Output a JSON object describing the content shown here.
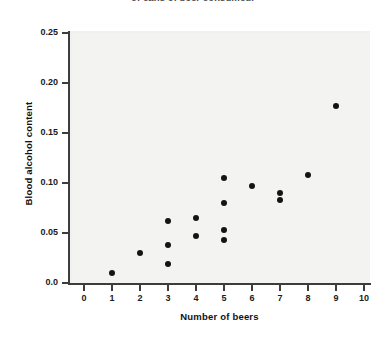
{
  "title": {
    "text": "of cans of beer consumed.",
    "clipped": true
  },
  "axis": {
    "xlabel": "Number of beers",
    "ylabel": "Blood alcohol content"
  },
  "chart_data": {
    "type": "scatter",
    "title": "of cans of beer consumed.",
    "xlabel": "Number of beers",
    "ylabel": "Blood alcohol content",
    "xlim": [
      0,
      10
    ],
    "ylim": [
      0.0,
      0.25
    ],
    "xticks": [
      0,
      1,
      2,
      3,
      4,
      5,
      6,
      7,
      8,
      9,
      10
    ],
    "xticklabels": [
      "0",
      "1",
      "2",
      "3",
      "4",
      "5",
      "6",
      "7",
      "8",
      "9",
      "10"
    ],
    "yticks": [
      0.0,
      0.05,
      0.1,
      0.15,
      0.2,
      0.25
    ],
    "yticklabels": [
      "0.0",
      "0.05",
      "0.10",
      "0.15",
      "0.20",
      "0.25"
    ],
    "grid": false,
    "legend": null,
    "marker_color": "#141414",
    "plot_background": "#f3f3f1",
    "points": [
      {
        "x": 1,
        "y": 0.01
      },
      {
        "x": 2,
        "y": 0.03
      },
      {
        "x": 3,
        "y": 0.019
      },
      {
        "x": 3,
        "y": 0.038
      },
      {
        "x": 3,
        "y": 0.062
      },
      {
        "x": 4,
        "y": 0.047
      },
      {
        "x": 4,
        "y": 0.065
      },
      {
        "x": 5,
        "y": 0.043
      },
      {
        "x": 5,
        "y": 0.053
      },
      {
        "x": 5,
        "y": 0.08
      },
      {
        "x": 5,
        "y": 0.105
      },
      {
        "x": 6,
        "y": 0.097
      },
      {
        "x": 7,
        "y": 0.083
      },
      {
        "x": 7,
        "y": 0.09
      },
      {
        "x": 8,
        "y": 0.108
      },
      {
        "x": 9,
        "y": 0.177
      }
    ]
  }
}
